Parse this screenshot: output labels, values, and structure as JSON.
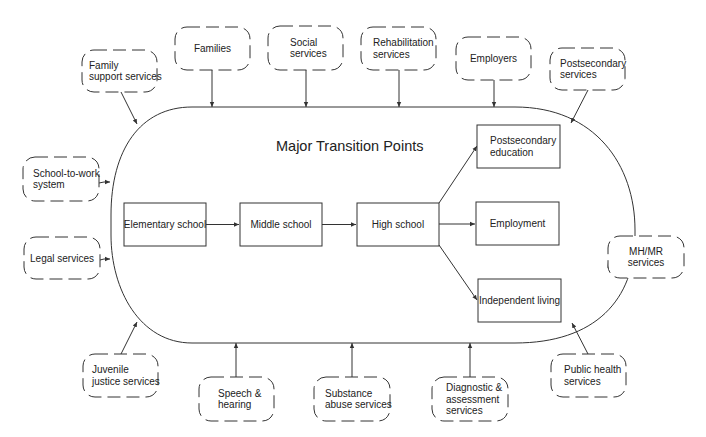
{
  "diagram": {
    "title": "Major Transition Points",
    "stages": [
      {
        "id": "elementary",
        "label": [
          "Elementary school"
        ]
      },
      {
        "id": "middle",
        "label": [
          "Middle school"
        ]
      },
      {
        "id": "high",
        "label": [
          "High school"
        ]
      },
      {
        "id": "postsec-ed",
        "label": [
          "Postsecondary",
          "education"
        ]
      },
      {
        "id": "employment",
        "label": [
          "Employment"
        ]
      },
      {
        "id": "independent",
        "label": [
          "Independent living"
        ]
      }
    ],
    "stage_links": [
      [
        "elementary",
        "middle"
      ],
      [
        "middle",
        "high"
      ],
      [
        "high",
        "postsec-ed"
      ],
      [
        "high",
        "employment"
      ],
      [
        "high",
        "independent"
      ]
    ],
    "services": [
      {
        "id": "family-support",
        "label": [
          "Family",
          "support services"
        ]
      },
      {
        "id": "families",
        "label": [
          "Families"
        ]
      },
      {
        "id": "social",
        "label": [
          "Social",
          "services"
        ]
      },
      {
        "id": "rehab",
        "label": [
          "Rehabilitation",
          "services"
        ]
      },
      {
        "id": "employers",
        "label": [
          "Employers"
        ]
      },
      {
        "id": "postsec-services",
        "label": [
          "Postsecondary",
          "services"
        ]
      },
      {
        "id": "school-to-work",
        "label": [
          "School-to-work",
          "system"
        ]
      },
      {
        "id": "legal",
        "label": [
          "Legal services"
        ]
      },
      {
        "id": "mhmr",
        "label": [
          "MH/MR",
          "services"
        ]
      },
      {
        "id": "juvenile",
        "label": [
          "Juvenile",
          "justice services"
        ]
      },
      {
        "id": "speech",
        "label": [
          "Speech &",
          "hearing"
        ]
      },
      {
        "id": "substance",
        "label": [
          "Substance",
          "abuse services"
        ]
      },
      {
        "id": "diagnostic",
        "label": [
          "Diagnostic &",
          "assessment",
          "services"
        ]
      },
      {
        "id": "public-health",
        "label": [
          "Public health",
          "services"
        ]
      }
    ]
  }
}
